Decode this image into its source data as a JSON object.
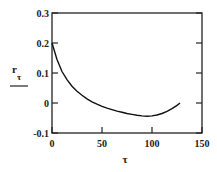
{
  "chart_data": {
    "type": "line",
    "title": "",
    "xlabel": "τ",
    "ylabel": "r_τ",
    "ylabel_main": "r",
    "ylabel_sub": "τ",
    "xlim": [
      0,
      150
    ],
    "ylim": [
      -0.1,
      0.3
    ],
    "xticks": [
      0,
      50,
      100,
      150
    ],
    "xtick_labels": [
      "0",
      "50",
      "100",
      "150"
    ],
    "yticks": [
      -0.1,
      0,
      0.1,
      0.2,
      0.3
    ],
    "ytick_labels": [
      "-0.1",
      "0",
      "0.1",
      "0.2",
      "0.3"
    ],
    "grid": false,
    "legend": null,
    "series": [
      {
        "name": "r_τ",
        "color": "#111111",
        "x": [
          0,
          5,
          10,
          15,
          20,
          25,
          30,
          35,
          40,
          45,
          50,
          55,
          60,
          65,
          70,
          75,
          80,
          85,
          90,
          95,
          100,
          105,
          110,
          115,
          120,
          125,
          128
        ],
        "y": [
          0.2,
          0.145,
          0.105,
          0.078,
          0.056,
          0.039,
          0.026,
          0.014,
          0.004,
          -0.004,
          -0.011,
          -0.017,
          -0.022,
          -0.027,
          -0.031,
          -0.035,
          -0.038,
          -0.041,
          -0.043,
          -0.044,
          -0.043,
          -0.04,
          -0.035,
          -0.028,
          -0.019,
          -0.008,
          0.0
        ]
      }
    ]
  }
}
